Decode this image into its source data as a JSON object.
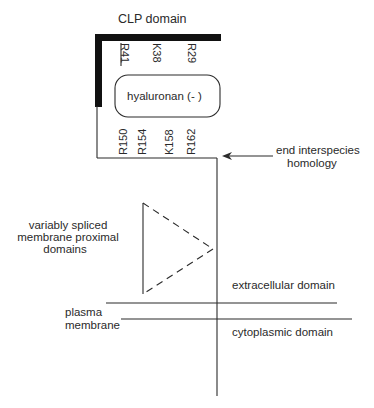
{
  "diagram": {
    "title": "CLP domain",
    "binding_site": {
      "label": "hyaluronan (- )"
    },
    "n_terminal_residues": [
      {
        "label": "R41",
        "underlined": true
      },
      {
        "label": "K38",
        "underlined": false
      },
      {
        "label": "R29",
        "underlined": false
      }
    ],
    "c_terminal_residues": [
      {
        "label": "R150"
      },
      {
        "label": "R154"
      },
      {
        "label": "K158"
      },
      {
        "label": "R162"
      }
    ],
    "annotations": {
      "homology_line1": "end interspecies",
      "homology_line2": "homology",
      "spliced_line1": "variably spliced",
      "spliced_line2": "membrane proximal",
      "spliced_line3": "domains",
      "extracellular": "extracellular domain",
      "cytoplasmic": "cytoplasmic domain",
      "membrane_line1": "plasma",
      "membrane_line2": "membrane"
    },
    "colors": {
      "line": "#2b2b2b",
      "thick_bar": "#111111",
      "text": "#2a2a2a",
      "background": "#ffffff"
    }
  }
}
